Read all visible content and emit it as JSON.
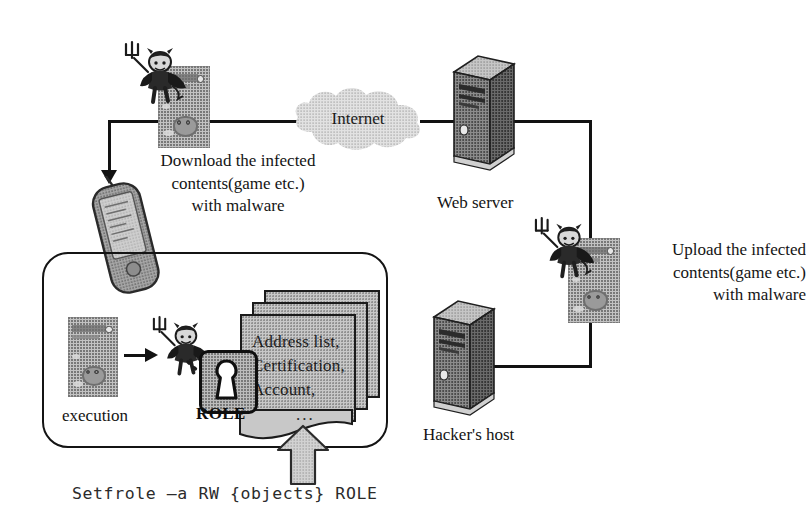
{
  "diagram": {
    "background_color": "#ffffff",
    "ink_color": "#141414",
    "fill_color": "#c2c2c2"
  },
  "nodes": {
    "internet": {
      "label": "Internet"
    },
    "web_server": {
      "label": "Web server"
    },
    "hackers_host": {
      "label": "Hacker's host"
    },
    "execution": {
      "label": "execution"
    },
    "role": {
      "label": "ROLE"
    }
  },
  "annotations": {
    "download": {
      "line1": "Download the infected",
      "line2": "contents(game etc.)",
      "line3": "with malware"
    },
    "upload": {
      "line1": "Upload the infected",
      "line2": "contents(game etc.)",
      "line3": "with malware"
    }
  },
  "documents": {
    "line1": "Address list,",
    "line2": "Certification,",
    "line3": "Account,",
    "ellipsis": "..."
  },
  "command": {
    "text": "Setfrole –a RW {objects} ROLE"
  },
  "icons": {
    "devil_top": "devil-imp-icon",
    "devil_right": "devil-imp-icon",
    "devil_inner": "devil-imp-icon",
    "content_top": "infected-content-icon",
    "content_right": "infected-content-icon",
    "content_inner": "infected-content-icon",
    "server_web": "server-tower-icon",
    "server_hacker": "server-tower-icon",
    "pda": "pda-device-icon",
    "cloud": "internet-cloud-icon",
    "lock": "keyhole-lock-icon",
    "up_arrow": "upward-block-arrow-icon"
  }
}
